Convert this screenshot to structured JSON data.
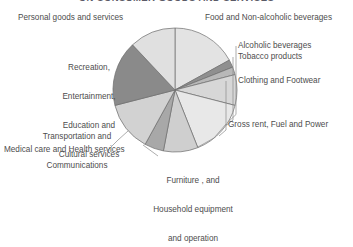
{
  "title": "ON CONSUMER GOODS AND SERVICES",
  "chart_data": {
    "type": "pie",
    "title": "ON CONSUMER GOODS AND SERVICES",
    "xlabel": "",
    "ylabel": "",
    "legend_position": "around-slices",
    "grid": false,
    "categories": [
      "Food and Non-alcoholic beverages",
      "Alcoholic beverages",
      "Tobacco products",
      "Clothing and Footwear",
      "Gross rent, Fuel and Power",
      "Furniture, and Household equipment and operation",
      "Medical care and Health services",
      "Transportation and Communications",
      "Recreation, Entertainment, Education and Cultural services",
      "Personal goods and services"
    ],
    "values": [
      17,
      2,
      2,
      8,
      15,
      9,
      5,
      13,
      17,
      12
    ],
    "colors": [
      "#e3e3e3",
      "#8f8f8f",
      "#b8b8b8",
      "#d7d7d7",
      "#e8e8e8",
      "#cfcfcf",
      "#a8a8a8",
      "#d2d2d2",
      "#8a8a8a",
      "#e0e0e0"
    ]
  },
  "labels": {
    "personal": "Personal goods and services",
    "recreation_l1": "Recreation,",
    "recreation_l2": "Entertainment,",
    "recreation_l3": "Education and",
    "recreation_l4": "Cultural services",
    "transportation_l1": "Transportation and",
    "transportation_l2": "Communications",
    "medical": "Medical care and Health services",
    "furniture_l1": "Furniture , and",
    "furniture_l2": "Household equipment",
    "furniture_l3": "and operation",
    "food": "Food and Non-alcoholic beverages",
    "alcoholic": "Alcoholic beverages",
    "tobacco": "Tobacco products",
    "clothing": "Clothing and Footwear",
    "gross_rent": "Gross rent, Fuel and Power"
  }
}
